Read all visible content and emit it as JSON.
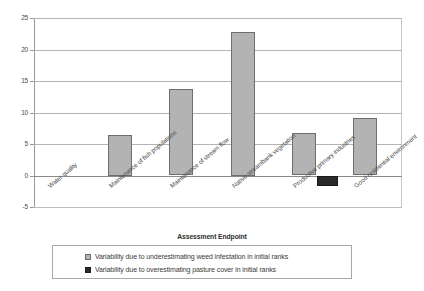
{
  "chart_data": {
    "type": "bar",
    "title": "",
    "xlabel": "Assessment Endpoint",
    "ylabel": "",
    "ylim": [
      -5,
      25
    ],
    "yticks": [
      25,
      20,
      15,
      10,
      5,
      0,
      -5
    ],
    "grid": true,
    "legend_position": "bottom",
    "categories": [
      "Water quality",
      "Maintenance of fish populations",
      "Maintenance of stream flow",
      "Native streambank vegetation",
      "Productive primary industries",
      "Good residential environment"
    ],
    "series": [
      {
        "name": "Variability due to underestimating weed infestation in initial ranks",
        "color": "#b3b3b3",
        "values": [
          0,
          6.5,
          13.7,
          22.8,
          6.7,
          9.1
        ]
      },
      {
        "name": "Variability due to overestimating pasture cover in initial ranks",
        "color": "#2a2a2a",
        "values": [
          0,
          0,
          0,
          0,
          -1.6,
          0
        ]
      }
    ]
  },
  "legend": {
    "items": [
      {
        "label": "Variability due to underestimating weed infestation in initial ranks"
      },
      {
        "label": "Variability due to overestimating pasture cover in initial ranks"
      }
    ]
  }
}
